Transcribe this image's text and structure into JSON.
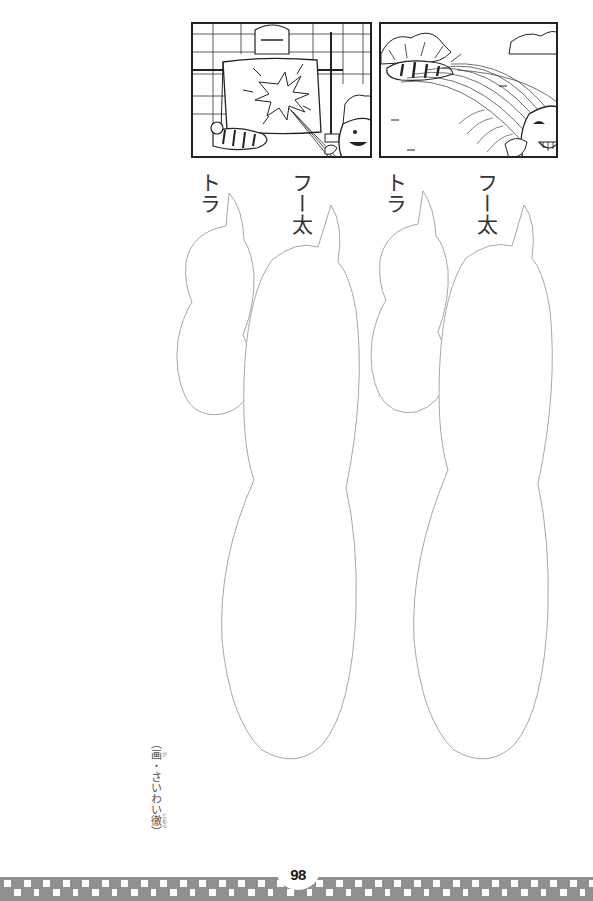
{
  "page": {
    "page_number": "98",
    "background": "#ffffff"
  },
  "panels": [
    {
      "id": "panel-1",
      "description": "Character holds up laundry sheet while being hit by a spray of water from a hose; a striped cat lies beneath; a boy holds the hose at lower right",
      "icon": "manga-panel-water-splash"
    },
    {
      "id": "panel-2",
      "description": "Boy with a big grin sprays water with a hose in a wide arc toward a striped cat in the bushes",
      "icon": "manga-panel-hose-spray"
    }
  ],
  "speakers": [
    {
      "label": "トラ"
    },
    {
      "label": "フー太"
    },
    {
      "label": "トラ"
    },
    {
      "label": "フー太"
    }
  ],
  "bubbles": [
    {
      "speaker": "トラ",
      "text": ""
    },
    {
      "speaker": "フー太",
      "text": ""
    },
    {
      "speaker": "トラ",
      "text": ""
    },
    {
      "speaker": "フー太",
      "text": ""
    }
  ],
  "credit": {
    "open_paren": "（",
    "prefix": "画",
    "prefix_ruby": "が",
    "separator": "・",
    "name_kana": "さいわい",
    "name_kanji": "徹",
    "name_ruby": "とおる",
    "close_paren": "）"
  },
  "footer": {
    "bar_color": "#8f8f8f",
    "square_color": "#ffffff"
  }
}
